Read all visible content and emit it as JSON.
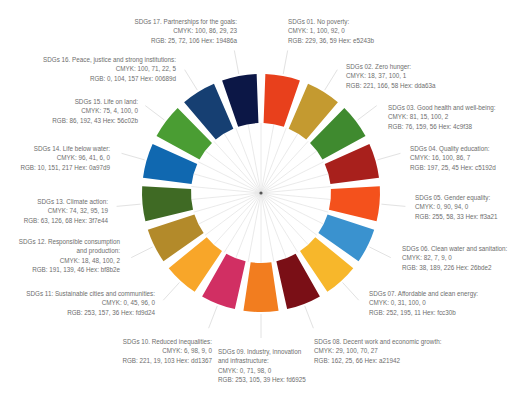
{
  "diagram": {
    "type": "color-wheel",
    "center": [
      261,
      193
    ],
    "outer_radius": 119,
    "inner_radius": 68,
    "segment_count": 17
  },
  "goals": [
    {
      "id": "01",
      "title": "SDGs 01. No poverty:",
      "cmyk": "CMYK: 1, 100, 92, 0",
      "rgb": "RGB: 229, 36, 59  Hex: e5243b",
      "color": "#e5243b",
      "label": {
        "x": 288,
        "y": 17,
        "align": "left"
      }
    },
    {
      "id": "02",
      "title": "SDGs 02. Zero hunger:",
      "cmyk": "CMYK: 18, 37, 100, 1",
      "rgb": "RGB: 221, 166, 58  Hex: dda63a",
      "color": "#dda63a",
      "label": {
        "x": 346,
        "y": 62,
        "align": "left"
      }
    },
    {
      "id": "03",
      "title": "SDGs 03. Good health and well-being:",
      "cmyk": "CMYK: 81, 15, 100, 2",
      "rgb": "RGB: 76, 159, 56  Hex: 4c9f38",
      "color": "#4c9f38",
      "label": {
        "x": 388,
        "y": 103,
        "align": "left"
      }
    },
    {
      "id": "04",
      "title": "SDGs 04. Quality education:",
      "cmyk": "CMYK: 16, 100, 86, 7",
      "rgb": "RGB: 197, 25, 45  Hex: c5192d",
      "color": "#c5192d",
      "label": {
        "x": 410,
        "y": 144,
        "align": "left"
      }
    },
    {
      "id": "05",
      "title": "SDGs 05. Gender equality:",
      "cmyk": "CMYK: 0, 90, 94, 0",
      "rgb": "RGB: 255, 58, 33  Hex: ff3a21",
      "color": "#ff3a21",
      "label": {
        "x": 415,
        "y": 193,
        "align": "left"
      }
    },
    {
      "id": "06",
      "title": "SDGs 06. Clean water and sanitation:",
      "cmyk": "CMYK: 82, 7, 9, 0",
      "rgb": "RGB: 38, 189, 226  Hex: 26bde2",
      "color": "#26bde2",
      "label": {
        "x": 402,
        "y": 244,
        "align": "left"
      }
    },
    {
      "id": "07",
      "title": "SDGs 07. Affordable and clean energy:",
      "cmyk": "CMYK: 0, 31, 100, 0",
      "rgb": "RGB: 252, 195, 11  Hex: fcc30b",
      "color": "#fcc30b",
      "label": {
        "x": 369,
        "y": 289,
        "align": "left"
      }
    },
    {
      "id": "08",
      "title": "SDGs 08. Decent work and economic growth:",
      "cmyk": "CMYK: 29, 100, 70, 27",
      "rgb": "RGB: 162, 25, 66  Hex: a21942",
      "color": "#a21942",
      "label": {
        "x": 314,
        "y": 337,
        "align": "left"
      }
    },
    {
      "id": "09",
      "title": "SDGs 09. Industry, innovation",
      "title2": "and infrastructure:",
      "cmyk": "CMYK: 0, 71, 98, 0",
      "rgb": "RGB: 253, 105, 39  Hex: fd6925",
      "color": "#fd6925",
      "label": {
        "x": 218,
        "y": 347,
        "align": "left"
      }
    },
    {
      "id": "10",
      "title": "SDGs 10. Reduced inequalities:",
      "cmyk": "CMYK: 6, 98, 9, 0",
      "rgb": "RGB: 221, 19, 103  Hex: dd1367",
      "color": "#dd1367",
      "label": {
        "x": 212,
        "y": 337,
        "align": "right"
      }
    },
    {
      "id": "11",
      "title": "SDGs 11: Sustainable cities and communities:",
      "cmyk": "CMYK: 0, 45, 96, 0",
      "rgb": "RGB: 253, 157, 36  Hex: fd9d24",
      "color": "#fd9d24",
      "label": {
        "x": 155,
        "y": 289,
        "align": "right"
      }
    },
    {
      "id": "12",
      "title": "SDGs 12. Responsible consumption",
      "title2": "and production:",
      "cmyk": "CMYK: 18, 48, 100, 2",
      "rgb": "RGB: 191, 139, 46  Hex: bf8b2e",
      "color": "#bf8b2e",
      "label": {
        "x": 120,
        "y": 237,
        "align": "right"
      }
    },
    {
      "id": "13",
      "title": "SDGs 13. Climate action:",
      "cmyk": "CMYK: 74, 32, 95, 19",
      "rgb": "RGB: 63, 126, 68  Hex: 3f7e44",
      "color": "#3f7e44",
      "label": {
        "x": 108,
        "y": 197,
        "align": "right"
      }
    },
    {
      "id": "14",
      "title": "SDGs 14. Life below water:",
      "cmyk": "CMYK: 96, 41, 6, 0",
      "rgb": "RGB: 10, 151, 217  Hex: 0a97d9",
      "color": "#0a97d9",
      "label": {
        "x": 110,
        "y": 144,
        "align": "right"
      }
    },
    {
      "id": "15",
      "title": "SDGs 15. Life on land:",
      "cmyk": "CMYK: 75, 4, 100, 0",
      "rgb": "RGB: 86, 192, 43  Hex: 56c02b",
      "color": "#56c02b",
      "label": {
        "x": 138,
        "y": 97,
        "align": "right"
      }
    },
    {
      "id": "16",
      "title": "SDGs 16. Peace, justice and strong institutions:",
      "cmyk": "CMYK: 100, 71, 22, 5",
      "rgb": "RGB: 0, 104, 157  Hex: 00689d",
      "color": "#00689d",
      "label": {
        "x": 176,
        "y": 55,
        "align": "right"
      }
    },
    {
      "id": "17",
      "title": "SDGs 17. Partnerships for the goals:",
      "cmyk": "CMYK: 100, 86, 29, 23",
      "rgb": "RGB: 25, 72, 106  Hex: 19486a",
      "color": "#19486a",
      "label": {
        "x": 237,
        "y": 17,
        "align": "right"
      }
    }
  ],
  "rendered_colors": [
    "#e8401c",
    "#c49a30",
    "#3f8a2f",
    "#a8201c",
    "#f4511c",
    "#3a92cf",
    "#f7b72b",
    "#7a0f16",
    "#f27d1f",
    "#d12f63",
    "#f8a629",
    "#b38a2a",
    "#3f6a24",
    "#1068b0",
    "#4a9d33",
    "#163f72",
    "#0c1746"
  ]
}
